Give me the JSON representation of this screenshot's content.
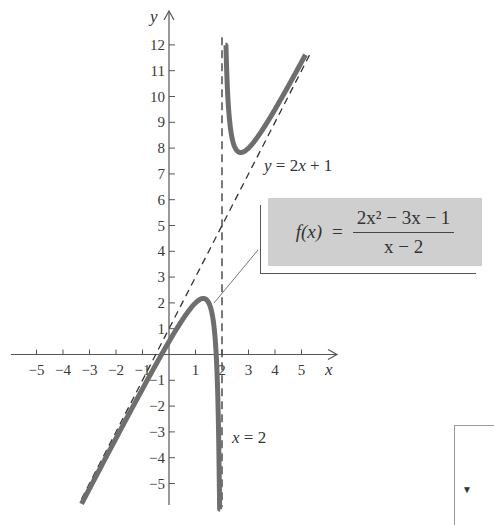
{
  "chart_data": {
    "type": "line",
    "title": "",
    "function_label": "f(x) =",
    "function_numerator": "2x² − 3x − 1",
    "function_denominator": "x − 2",
    "xlabel": "x",
    "ylabel": "y",
    "xlim": [
      -6,
      5.5
    ],
    "ylim": [
      -6,
      12.5
    ],
    "x_ticks": [
      -5,
      -4,
      -3,
      -2,
      -1,
      1,
      2,
      3,
      4,
      5
    ],
    "x_tick_labels": [
      "−5",
      "−4",
      "−3",
      "−2",
      "−1",
      "1",
      "2",
      "3",
      "4",
      "5"
    ],
    "y_ticks": [
      -5,
      -4,
      -3,
      -2,
      -1,
      1,
      2,
      3,
      4,
      5,
      6,
      7,
      8,
      9,
      10,
      11,
      12
    ],
    "y_tick_labels": [
      "−5",
      "−4",
      "−3",
      "−2",
      "−1",
      "1",
      "2",
      "3",
      "4",
      "5",
      "6",
      "7",
      "8",
      "9",
      "10",
      "11",
      "12"
    ],
    "grid": false,
    "series": [
      {
        "name": "f(x) left branch",
        "style": "solid-thick",
        "color": "#6e6e6e",
        "x_range": [
          -3.3,
          1.93
        ]
      },
      {
        "name": "f(x) right branch",
        "style": "solid-thick",
        "color": "#6e6e6e",
        "x_range": [
          2.13,
          5.15
        ]
      },
      {
        "name": "slant asymptote",
        "label": "y = 2x + 1",
        "style": "dashed",
        "color": "#333333",
        "slope": 2,
        "intercept": 1,
        "x_range": [
          -3.3,
          5.5
        ]
      },
      {
        "name": "vertical asymptote",
        "label": "x = 2",
        "style": "dashed",
        "color": "#333333",
        "x": 2,
        "y_range": [
          -6,
          12.3
        ]
      }
    ],
    "sample_points": [
      {
        "x": -3,
        "y": -5.6
      },
      {
        "x": -1,
        "y": -1.33
      },
      {
        "x": 0,
        "y": 0.5
      },
      {
        "x": 1,
        "y": 2
      },
      {
        "x": 1.5,
        "y": 2
      },
      {
        "x": 1.9,
        "y": -5.2
      },
      {
        "x": 2.2,
        "y": 11.2
      },
      {
        "x": 2.5,
        "y": 7.8
      },
      {
        "x": 3,
        "y": 8
      },
      {
        "x": 4,
        "y": 9.5
      },
      {
        "x": 5,
        "y": 11.33
      }
    ],
    "annotations": [
      {
        "text": "y = 2x + 1",
        "near": "slant asymptote, right of x=2, y≈7.4"
      },
      {
        "text": "x = 2",
        "near": "vertical asymptote, y≈-3.3"
      }
    ]
  },
  "annotations": {
    "slant_label": "y = 2x + 1",
    "vertical_label": "x = 2"
  },
  "formula": {
    "lhs": "f(x)",
    "equals": "=",
    "numerator": "2x² − 3x − 1",
    "denominator": "x − 2"
  },
  "partial_box": {
    "glyph": "▼"
  }
}
